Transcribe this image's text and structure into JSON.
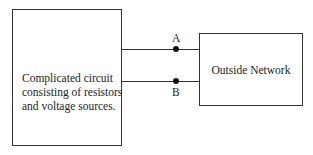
{
  "left_box": {
    "lines": [
      "Complicated circuit",
      "consisting of resistors",
      "and voltage sources."
    ]
  },
  "right_box": {
    "label": "Outside Network"
  },
  "terminals": {
    "a": "A",
    "b": "B"
  }
}
